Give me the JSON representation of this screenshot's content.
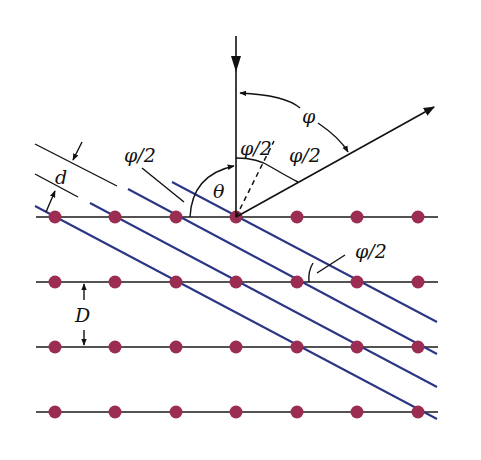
{
  "diagram": {
    "colors": {
      "background": "#ffffff",
      "atom": "#9b2d52",
      "lattice_row": "#1a1a1a",
      "bragg_plane": "#2a3585",
      "ray": "#111111"
    },
    "labels": {
      "phi": "φ",
      "phi_half_top": "φ/2",
      "phi_half_right": "φ/2",
      "phi_half_left": "φ/2",
      "phi_half_lower": "φ/2",
      "theta": "θ",
      "d": "d",
      "D": "D"
    },
    "lattice": {
      "rows_y": [
        217,
        282,
        347,
        412
      ],
      "cols_x": [
        55,
        115,
        176,
        236,
        297,
        357,
        418
      ],
      "row_x_start": 36,
      "row_x_end": 438,
      "row_spacing_label": "D"
    },
    "bragg_planes": [
      {
        "x1": 35,
        "y1": 206,
        "x2": 437,
        "y2": 419
      },
      {
        "x1": 90,
        "y1": 203,
        "x2": 437,
        "y2": 387
      },
      {
        "x1": 128,
        "y1": 189,
        "x2": 437,
        "y2": 354
      },
      {
        "x1": 172,
        "y1": 182,
        "x2": 437,
        "y2": 322
      }
    ],
    "plane_spacing_label": "d"
  }
}
